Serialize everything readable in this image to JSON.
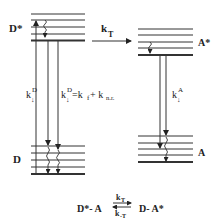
{
  "diagram": {
    "type": "energy-level diagram (Jablonski-type, energy transfer)",
    "donor": {
      "excited_label": "D*",
      "ground_label": "D",
      "radiative_rate_label": {
        "k": "k",
        "sup": "D",
        "sub": "↓"
      },
      "total_rate_label": {
        "k": "k",
        "sup": "D",
        "sub": "↓",
        "eq": "=k",
        "f_sub": "f",
        "plus": " + k",
        "nr_sub": "n.r."
      }
    },
    "acceptor": {
      "excited_label": "A*",
      "ground_label": "A",
      "rate_label": {
        "k": "k",
        "sup": "A",
        "sub": "↓"
      }
    },
    "transfer": {
      "label": "k",
      "sub": "T"
    },
    "equilibrium": {
      "left": "D*- A",
      "right": "D- A*",
      "forward": {
        "k": "k",
        "sub": "T"
      },
      "backward": {
        "k": "k",
        "sub": "-T"
      }
    },
    "colors": {
      "line": "#222222",
      "background": "#ffffff"
    }
  }
}
